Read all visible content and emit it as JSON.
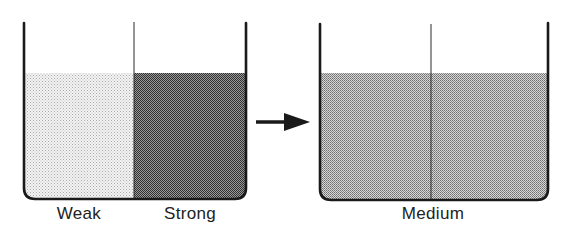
{
  "diagram": {
    "before": {
      "left_label": "Weak",
      "right_label": "Strong"
    },
    "after": {
      "label": "Medium"
    },
    "arrow": "right-arrow"
  },
  "colors": {
    "outline": "#1a1a1a",
    "weak_fill": "#e2e2e2",
    "strong_fill": "#6a6a6a",
    "medium_fill": "#b0b0b0"
  }
}
